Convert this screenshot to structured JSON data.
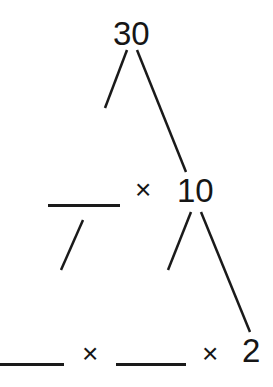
{
  "diagram": {
    "type": "factor-tree",
    "root": {
      "value": "30"
    },
    "level2": {
      "left": {
        "value": "",
        "blank": true
      },
      "operator": "×",
      "right": {
        "value": "10"
      }
    },
    "level3": {
      "items": [
        {
          "value": "",
          "blank": true
        },
        {
          "operator": "×"
        },
        {
          "value": "",
          "blank": true
        },
        {
          "operator": "×"
        },
        {
          "value": "2"
        }
      ]
    },
    "line_color": "#1a1a1a"
  }
}
